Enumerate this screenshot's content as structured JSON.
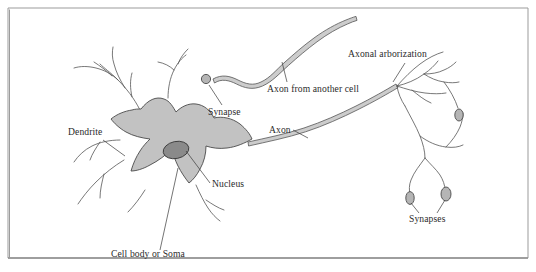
{
  "figure": {
    "width": 536,
    "height": 272,
    "background": "#ffffff",
    "frame": {
      "stroke": "#9b9b9b",
      "inset_left": 8,
      "inset_top": 8,
      "inset_right": 528,
      "inset_bottom": 258
    }
  },
  "colors": {
    "soma_fill": "#c2c2c2",
    "soma_stroke": "#4a4a4a",
    "nucleus_fill": "#8a8a8a",
    "nucleus_stroke": "#3d3d3d",
    "axon_fill": "#cccccc",
    "axon_stroke": "#555555",
    "neurite_stroke": "#555555",
    "synapse_fill": "#b5b5b5",
    "synapse_stroke": "#4a4a4a",
    "label_text": "#2b2b2b",
    "leader_line": "#3a3a3a"
  },
  "labels": [
    {
      "id": "dendrite",
      "text": "Dendrite",
      "x": 68,
      "y": 135,
      "anchor": "start"
    },
    {
      "id": "synapse",
      "text": "Synapse",
      "x": 208,
      "y": 115,
      "anchor": "start"
    },
    {
      "id": "axon-from-another-cell",
      "text": "Axon from another cell",
      "x": 267,
      "y": 92,
      "anchor": "start"
    },
    {
      "id": "axonal-arborization",
      "text": "Axonal arborization",
      "x": 348,
      "y": 57,
      "anchor": "start"
    },
    {
      "id": "axon",
      "text": "Axon",
      "x": 269,
      "y": 133,
      "anchor": "start"
    },
    {
      "id": "nucleus",
      "text": "Nucleus",
      "x": 212,
      "y": 187,
      "anchor": "start"
    },
    {
      "id": "cell-body-or-soma",
      "text": "Cell body or Soma",
      "x": 111,
      "y": 257,
      "anchor": "start"
    },
    {
      "id": "synapses",
      "text": "Synapses",
      "x": 409,
      "y": 222,
      "anchor": "start"
    }
  ],
  "parts": {
    "soma": "cell body",
    "nucleus": "nucleus",
    "dendrites": "dendritic branches",
    "incoming_axon": "axon from another cell",
    "outgoing_axon": "axon",
    "arborization": "axonal arborization",
    "synapse_boutons": "synaptic terminals"
  }
}
